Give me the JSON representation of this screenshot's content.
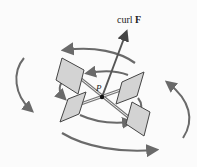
{
  "diagram": {
    "labels": {
      "curl_prefix": "curl ",
      "curl_vector": "F",
      "point": "P"
    },
    "colors": {
      "arrow": "#6a6a6a",
      "paddle_fill": "#d3d3d3",
      "paddle_stroke": "#444444",
      "axis": "#555555",
      "background": "#fbfbfb"
    },
    "elements": {
      "curl_vector": "arrow from P upward labeled curl F",
      "paddles": 4,
      "rotation_arrows": [
        "top outer arc (leftward)",
        "inner arc (leftward)",
        "left arc (downward)",
        "right arc (upward)",
        "bottom outer arc (rightward)",
        "inner lower arc (rightward)"
      ]
    }
  }
}
